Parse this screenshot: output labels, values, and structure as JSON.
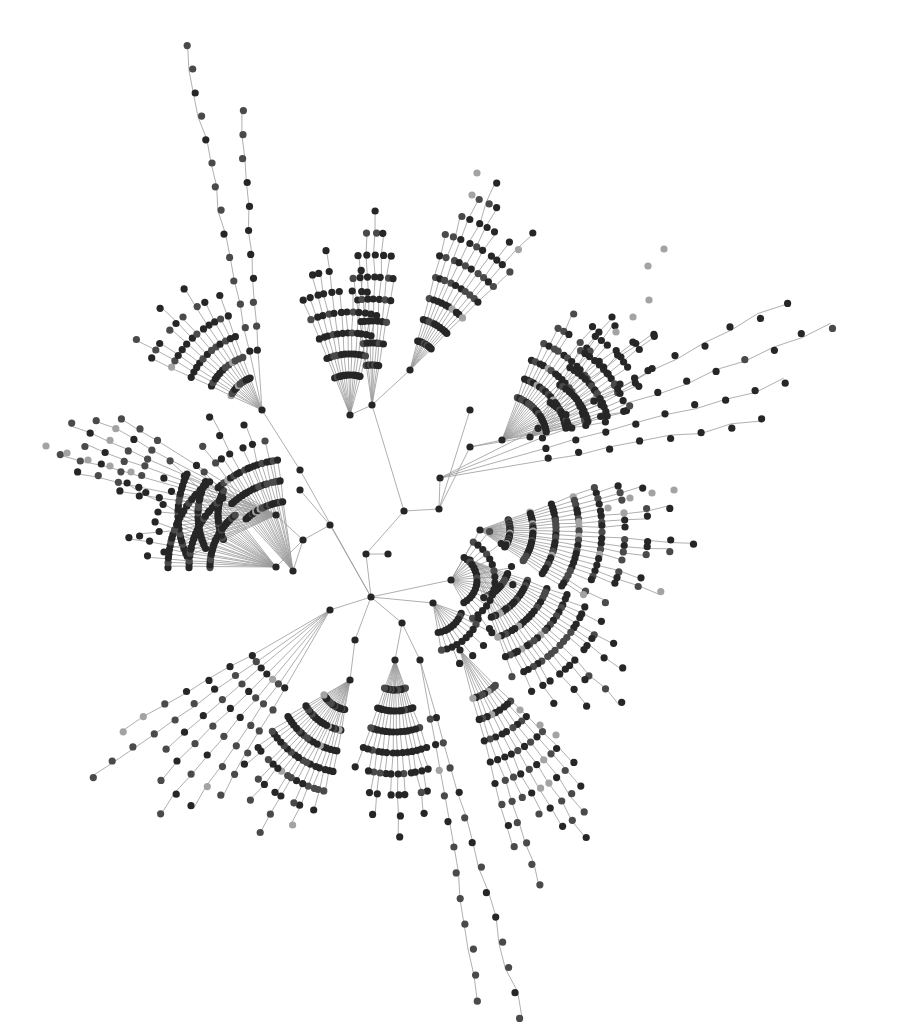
{
  "diagram": {
    "type": "radial-tree-network",
    "width": 908,
    "height": 1026,
    "background": "#ffffff",
    "style": {
      "edge_color": "#9a9a9a",
      "edge_width": 0.8,
      "node_radius": 3.6,
      "node_colors": {
        "dark": "#262626",
        "mid": "#4a4a4a",
        "light": "#a3a3a3"
      }
    },
    "root": {
      "x": 371,
      "y": 597
    },
    "skeleton": {
      "nodes": [
        {
          "id": "R",
          "x": 371,
          "y": 597
        },
        {
          "id": "a1",
          "x": 366,
          "y": 554
        },
        {
          "id": "a2",
          "x": 388,
          "y": 554
        },
        {
          "id": "a3",
          "x": 404,
          "y": 511
        },
        {
          "id": "a4",
          "x": 439,
          "y": 509
        },
        {
          "id": "a5",
          "x": 451,
          "y": 580
        },
        {
          "id": "b1",
          "x": 330,
          "y": 525
        },
        {
          "id": "b2",
          "x": 303,
          "y": 540
        },
        {
          "id": "b3",
          "x": 276,
          "y": 515
        },
        {
          "id": "b4",
          "x": 276,
          "y": 567
        },
        {
          "id": "b5",
          "x": 293,
          "y": 571
        },
        {
          "id": "b6",
          "x": 300,
          "y": 490
        },
        {
          "id": "c1",
          "x": 355,
          "y": 640
        },
        {
          "id": "c2",
          "x": 402,
          "y": 623
        },
        {
          "id": "c3",
          "x": 330,
          "y": 610
        },
        {
          "id": "c4",
          "x": 433,
          "y": 603
        },
        {
          "id": "d1",
          "x": 440,
          "y": 478
        },
        {
          "id": "d2",
          "x": 470,
          "y": 447
        },
        {
          "id": "d3",
          "x": 502,
          "y": 440
        },
        {
          "id": "d4",
          "x": 530,
          "y": 437
        },
        {
          "id": "e1",
          "x": 372,
          "y": 405
        },
        {
          "id": "e2",
          "x": 350,
          "y": 415
        },
        {
          "id": "e3",
          "x": 300,
          "y": 470
        },
        {
          "id": "e4",
          "x": 262,
          "y": 410
        },
        {
          "id": "e5",
          "x": 410,
          "y": 370
        },
        {
          "id": "e6",
          "x": 470,
          "y": 410
        },
        {
          "id": "f1",
          "x": 470,
          "y": 560
        },
        {
          "id": "f2",
          "x": 480,
          "y": 530
        },
        {
          "id": "g1",
          "x": 350,
          "y": 680
        },
        {
          "id": "g2",
          "x": 395,
          "y": 660
        },
        {
          "id": "g3",
          "x": 420,
          "y": 660
        },
        {
          "id": "g4",
          "x": 460,
          "y": 650
        }
      ],
      "edges": [
        [
          "R",
          "a1"
        ],
        [
          "a1",
          "a2"
        ],
        [
          "a1",
          "a3"
        ],
        [
          "a3",
          "a4"
        ],
        [
          "R",
          "a5"
        ],
        [
          "R",
          "b1"
        ],
        [
          "b1",
          "b2"
        ],
        [
          "b2",
          "b3"
        ],
        [
          "b2",
          "b4"
        ],
        [
          "b2",
          "b5"
        ],
        [
          "b1",
          "b6"
        ],
        [
          "R",
          "c1"
        ],
        [
          "R",
          "c2"
        ],
        [
          "R",
          "c3"
        ],
        [
          "R",
          "c4"
        ],
        [
          "a4",
          "d1"
        ],
        [
          "a4",
          "d2"
        ],
        [
          "d2",
          "d3"
        ],
        [
          "d2",
          "d4"
        ],
        [
          "a3",
          "e1"
        ],
        [
          "e1",
          "e2"
        ],
        [
          "R",
          "e3"
        ],
        [
          "e3",
          "e4"
        ],
        [
          "e1",
          "e5"
        ],
        [
          "a4",
          "e6"
        ],
        [
          "a5",
          "f1"
        ],
        [
          "a5",
          "f2"
        ],
        [
          "c1",
          "g1"
        ],
        [
          "c2",
          "g2"
        ],
        [
          "c2",
          "g3"
        ],
        [
          "c4",
          "g4"
        ]
      ]
    },
    "clusters": [
      {
        "name": "left-arcs-upper",
        "hub": "b3",
        "cx": 276,
        "cy": 515,
        "angle_start": 155,
        "angle_end": 205,
        "count": 22,
        "r0": 58,
        "dr": 20,
        "lengths": [
          3,
          3,
          3,
          4,
          3,
          3,
          3,
          5,
          3,
          3,
          3,
          4,
          3,
          3,
          6,
          3,
          3,
          3,
          4,
          3,
          3,
          3
        ],
        "tones": "dark"
      },
      {
        "name": "left-arcs-mid",
        "hub": "b4",
        "cx": 276,
        "cy": 567,
        "angle_start": 180,
        "angle_end": 232,
        "count": 24,
        "r0": 66,
        "dr": 21,
        "lengths": [
          3,
          3,
          4,
          3,
          3,
          5,
          3,
          3,
          3,
          4,
          3,
          3,
          3,
          6,
          3,
          3,
          4,
          3,
          3,
          3,
          5,
          3,
          3,
          4
        ],
        "tones": "dark"
      },
      {
        "name": "left-arcs-lower",
        "hub": "b5",
        "cx": 293,
        "cy": 571,
        "angle_start": 228,
        "angle_end": 262,
        "count": 18,
        "r0": 70,
        "dr": 21,
        "lengths": [
          4,
          3,
          3,
          5,
          3,
          4,
          3,
          6,
          3,
          3,
          4,
          3,
          5,
          3,
          3,
          4,
          3,
          3
        ],
        "tones": "mixed"
      },
      {
        "name": "left-far-chains",
        "hub": "b3",
        "cx": 276,
        "cy": 515,
        "angle_start": 192,
        "angle_end": 212,
        "count": 6,
        "r0": 140,
        "dr": 21,
        "lengths": [
          4,
          5,
          4,
          5,
          4,
          3
        ],
        "tones": "mid"
      },
      {
        "name": "upper-left-fans",
        "hub": "e4",
        "cx": 262,
        "cy": 410,
        "angle_start": 205,
        "angle_end": 250,
        "count": 12,
        "r0": 34,
        "dr": 22,
        "lengths": [
          5,
          6,
          5,
          4,
          5,
          6,
          5,
          4,
          6,
          5,
          4,
          5
        ],
        "tones": "mixed"
      },
      {
        "name": "upper-left-column",
        "hub": "e2",
        "cx": 350,
        "cy": 415,
        "angle_start": 248,
        "angle_end": 285,
        "count": 12,
        "r0": 40,
        "dr": 21,
        "lengths": [
          5,
          5,
          6,
          6,
          7,
          5,
          4,
          5,
          6,
          5,
          4,
          4
        ],
        "tones": "dark"
      },
      {
        "name": "upper-center-stack",
        "hub": "e1",
        "cx": 372,
        "cy": 405,
        "angle_start": 262,
        "angle_end": 280,
        "count": 7,
        "r0": 40,
        "dr": 22,
        "lengths": [
          5,
          6,
          7,
          8,
          7,
          6,
          5
        ],
        "tones": "dark"
      },
      {
        "name": "upper-long-chain",
        "hub": "e4",
        "cx": 262,
        "cy": 410,
        "angle_start": 258,
        "angle_end": 266,
        "count": 2,
        "r0": 60,
        "dr": 24,
        "lengths": [
          14,
          11
        ],
        "tones": "mid"
      },
      {
        "name": "upper-right-fans",
        "hub": "e5",
        "cx": 410,
        "cy": 370,
        "angle_start": 285,
        "angle_end": 315,
        "count": 10,
        "r0": 30,
        "dr": 22,
        "lengths": [
          6,
          7,
          8,
          9,
          8,
          7,
          6,
          7,
          8,
          6
        ],
        "tones": "mixed"
      },
      {
        "name": "right-upper-arcs",
        "hub": "d3",
        "cx": 502,
        "cy": 440,
        "angle_start": 290,
        "angle_end": 350,
        "count": 20,
        "r0": 45,
        "dr": 20,
        "lengths": [
          3,
          4,
          5,
          6,
          5,
          4,
          6,
          7,
          5,
          4,
          6,
          8,
          5,
          4,
          5,
          6,
          4,
          3,
          5,
          4
        ],
        "tones": "mixed"
      },
      {
        "name": "right-upper-arcs-2",
        "hub": "d4",
        "cx": 530,
        "cy": 437,
        "angle_start": 300,
        "angle_end": 345,
        "count": 14,
        "r0": 40,
        "dr": 20,
        "lengths": [
          4,
          5,
          6,
          5,
          4,
          6,
          7,
          5,
          4,
          6,
          5,
          4,
          3,
          4
        ],
        "tones": "dark"
      },
      {
        "name": "right-long-rays",
        "hub": "d1",
        "cx": 440,
        "cy": 478,
        "angle_start": 333,
        "angle_end": 350,
        "count": 4,
        "r0": 110,
        "dr": 31,
        "lengths": [
          10,
          11,
          9,
          8
        ],
        "tones": "dark"
      },
      {
        "name": "right-arcs",
        "hub": "f2",
        "cx": 480,
        "cy": 530,
        "angle_start": 340,
        "angle_end": 395,
        "count": 22,
        "r0": 30,
        "dr": 23,
        "lengths": [
          5,
          6,
          7,
          6,
          5,
          8,
          7,
          6,
          5,
          9,
          8,
          7,
          6,
          5,
          7,
          8,
          6,
          5,
          4,
          6,
          5,
          4
        ],
        "tones": "mixed"
      },
      {
        "name": "lower-right-arcs",
        "hub": "f1",
        "cx": 470,
        "cy": 560,
        "angle_start": 20,
        "angle_end": 70,
        "count": 20,
        "r0": 40,
        "dr": 21,
        "lengths": [
          4,
          5,
          6,
          5,
          7,
          6,
          8,
          6,
          5,
          9,
          7,
          6,
          8,
          5,
          6,
          7,
          5,
          6,
          4,
          5
        ],
        "tones": "mixed"
      },
      {
        "name": "bottom-right-rays",
        "hub": "g4",
        "cx": 460,
        "cy": 650,
        "angle_start": 45,
        "angle_end": 75,
        "count": 9,
        "r0": 50,
        "dr": 22,
        "lengths": [
          6,
          7,
          8,
          9,
          8,
          7,
          6,
          10,
          8
        ],
        "tones": "mixed"
      },
      {
        "name": "bottom-arcs",
        "hub": "g2",
        "cx": 395,
        "cy": 660,
        "angle_start": 70,
        "angle_end": 110,
        "count": 14,
        "r0": 30,
        "dr": 21,
        "lengths": [
          4,
          5,
          6,
          7,
          5,
          6,
          8,
          6,
          5,
          7,
          6,
          5,
          4,
          5
        ],
        "tones": "dark"
      },
      {
        "name": "bottom-long-chain",
        "hub": "g3",
        "cx": 420,
        "cy": 660,
        "angle_start": 74,
        "angle_end": 80,
        "count": 2,
        "r0": 60,
        "dr": 26,
        "lengths": [
          13,
          12
        ],
        "tones": "mid"
      },
      {
        "name": "bottom-left-arcs",
        "hub": "g1",
        "cx": 350,
        "cy": 680,
        "angle_start": 100,
        "angle_end": 150,
        "count": 18,
        "r0": 30,
        "dr": 21,
        "lengths": [
          4,
          5,
          6,
          5,
          7,
          6,
          5,
          8,
          6,
          5,
          7,
          6,
          5,
          4,
          6,
          5,
          4,
          3
        ],
        "tones": "mixed"
      },
      {
        "name": "bottom-left-rays",
        "hub": "c3",
        "cx": 330,
        "cy": 610,
        "angle_start": 120,
        "angle_end": 150,
        "count": 7,
        "r0": 90,
        "dr": 25,
        "lengths": [
          6,
          7,
          8,
          7,
          6,
          9,
          7
        ],
        "tones": "mid"
      },
      {
        "name": "inner-ring-right",
        "hub": "a5",
        "cx": 451,
        "cy": 580,
        "angle_start": 300,
        "angle_end": 420,
        "count": 16,
        "r0": 26,
        "dr": 18,
        "lengths": [
          2,
          3,
          2,
          3,
          2,
          2,
          3,
          2,
          3,
          2,
          2,
          3,
          2,
          2,
          3,
          2
        ],
        "tones": "dark"
      },
      {
        "name": "inner-ring-bottom",
        "hub": "c4",
        "cx": 433,
        "cy": 603,
        "angle_start": 20,
        "angle_end": 80,
        "count": 10,
        "r0": 30,
        "dr": 18,
        "lengths": [
          2,
          3,
          2,
          3,
          2,
          3,
          2,
          3,
          2,
          2
        ],
        "tones": "dark"
      }
    ],
    "light_accents": [
      {
        "x": 46,
        "y": 446
      },
      {
        "x": 67,
        "y": 453
      },
      {
        "x": 88,
        "y": 460
      },
      {
        "x": 110,
        "y": 466
      },
      {
        "x": 131,
        "y": 472
      },
      {
        "x": 664,
        "y": 249
      },
      {
        "x": 648,
        "y": 266
      },
      {
        "x": 649,
        "y": 300
      },
      {
        "x": 633,
        "y": 317
      },
      {
        "x": 616,
        "y": 332
      },
      {
        "x": 477,
        "y": 173
      },
      {
        "x": 472,
        "y": 195
      },
      {
        "x": 608,
        "y": 508
      },
      {
        "x": 630,
        "y": 498
      },
      {
        "x": 652,
        "y": 493
      },
      {
        "x": 674,
        "y": 490
      },
      {
        "x": 520,
        "y": 710
      },
      {
        "x": 540,
        "y": 725
      },
      {
        "x": 556,
        "y": 735
      }
    ]
  }
}
